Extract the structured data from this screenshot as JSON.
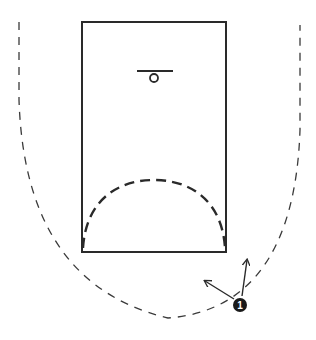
{
  "diagram": {
    "type": "basketball-play-diagram",
    "colors": {
      "background": "#ffffff",
      "line": "#2a2a2a",
      "dash": "#3a3a3a",
      "player_fill": "#1a1a1a",
      "player_text": "#ffffff"
    },
    "lane": {
      "x": 82,
      "y": 22,
      "width": 144,
      "height": 230
    },
    "basket": {
      "backboard": {
        "x1": 137,
        "y1": 71,
        "x2": 173,
        "y2": 71
      },
      "rim": {
        "cx": 154,
        "cy": 78,
        "r": 4
      }
    },
    "restricted_arc": {
      "path": "M 83 248 C 86 200, 118 180, 154 180 C 190 180, 222 200, 225 248"
    },
    "perimeter_path": {
      "path": "M 19 22 L 19 100 C 22 190, 50 290, 168 318 C 250 312, 296 250, 300 130 L 300 25"
    },
    "players": [
      {
        "id": "1",
        "label": "1",
        "cx": 240,
        "cy": 305,
        "r": 7
      }
    ],
    "arrows": [
      {
        "name": "cut-arrow-up",
        "x1": 242,
        "y1": 296,
        "x2": 247,
        "y2": 260
      },
      {
        "name": "cut-arrow-left",
        "x1": 234,
        "y1": 299,
        "x2": 205,
        "y2": 281
      }
    ]
  }
}
